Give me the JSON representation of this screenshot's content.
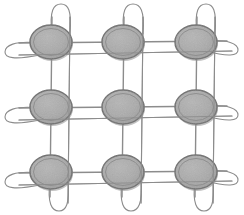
{
  "figure": {
    "caption": "",
    "domain": "diagram",
    "style": "monochrome line drawing, scanned halftone shading",
    "canvas": {
      "width": 244,
      "height": 215,
      "background": "#ffffff"
    }
  },
  "palette": {
    "background": "#ffffff",
    "wire_stroke": "#8c8c8c",
    "wire_stroke_dark": "#7a7a7a",
    "disc_fill": "#a8a8a8",
    "disc_fill_inner": "#b0b0b0",
    "disc_rim_outer": "#6e6e6e",
    "disc_rim_inner": "#8f8f8f",
    "disc_shadow": "#909090"
  },
  "geometry": {
    "rows": 3,
    "columns": 3,
    "disc_count": 9,
    "column_centers_x": [
      51,
      123,
      196
    ],
    "row_centers_y": [
      42,
      107,
      172
    ],
    "disc_radius_x": 21,
    "disc_radius_y": 17,
    "disc_rim_gap": 3.5,
    "wire_width": 1.4,
    "wire_width_thin": 1.1
  },
  "grid_lines": {
    "horizontal_label": "horizontal interconnect wires",
    "horizontal_y": [
      42,
      107,
      172
    ],
    "horizontal_offset_y": [
      52,
      117,
      182
    ],
    "vertical_label": "vertical interconnect wires",
    "vertical_x": [
      51,
      123,
      196
    ],
    "vertical_offset_x": [
      69,
      142,
      214
    ],
    "x_start": 18,
    "x_end": 228,
    "y_start": 16,
    "y_end": 198
  },
  "loops": {
    "top_label": "upper return loops",
    "top_count": 3,
    "top_height": 30,
    "bottom_label": "lower return loops",
    "bottom_count": 3,
    "bottom_height": 30,
    "left_label": "left return loops",
    "left_count": 3,
    "left_width": 42,
    "right_label": "right return loops",
    "right_count": 3,
    "right_width": 36
  },
  "discs": [
    {
      "id": "disc-r1-c1",
      "row": 1,
      "col": 1,
      "cx": 51,
      "cy": 42
    },
    {
      "id": "disc-r1-c2",
      "row": 1,
      "col": 2,
      "cx": 123,
      "cy": 42
    },
    {
      "id": "disc-r1-c3",
      "row": 1,
      "col": 3,
      "cx": 196,
      "cy": 42
    },
    {
      "id": "disc-r2-c1",
      "row": 2,
      "col": 1,
      "cx": 51,
      "cy": 107
    },
    {
      "id": "disc-r2-c2",
      "row": 2,
      "col": 2,
      "cx": 123,
      "cy": 107
    },
    {
      "id": "disc-r2-c3",
      "row": 2,
      "col": 3,
      "cx": 196,
      "cy": 107
    },
    {
      "id": "disc-r3-c1",
      "row": 3,
      "col": 1,
      "cx": 51,
      "cy": 172
    },
    {
      "id": "disc-r3-c2",
      "row": 3,
      "col": 2,
      "cx": 123,
      "cy": 172
    },
    {
      "id": "disc-r3-c3",
      "row": 3,
      "col": 3,
      "cx": 196,
      "cy": 172
    }
  ],
  "labels": {
    "visible_text": []
  }
}
